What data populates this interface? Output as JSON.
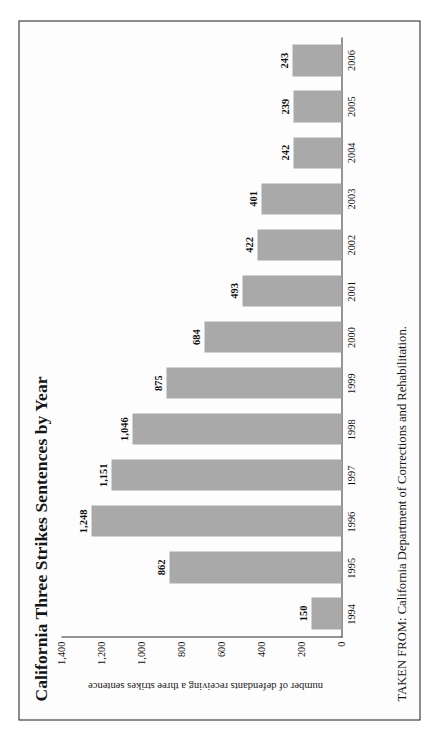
{
  "document": {
    "source_note": "TAKEN FROM: California Department of Corrections and Rehabilitation."
  },
  "chart_data": {
    "type": "bar",
    "title": "California Three Strikes Sentences by Year",
    "xlabel": "",
    "ylabel": "number of defendants receiving a three strikes sentence",
    "categories": [
      "1994",
      "1995",
      "1996",
      "1997",
      "1998",
      "1999",
      "2000",
      "2001",
      "2002",
      "2003",
      "2004",
      "2005",
      "2006"
    ],
    "values": [
      150,
      862,
      1248,
      1151,
      1046,
      875,
      684,
      493,
      422,
      401,
      242,
      239,
      243
    ],
    "value_labels": [
      "150",
      "862",
      "1,248",
      "1,151",
      "1,046",
      "875",
      "684",
      "493",
      "422",
      "401",
      "242",
      "239",
      "243"
    ],
    "ylim": [
      0,
      1400
    ],
    "yticks": [
      0,
      200,
      400,
      600,
      800,
      1000,
      1200,
      1400
    ],
    "ytick_labels": [
      "0",
      "200",
      "400",
      "600",
      "800",
      "1,000",
      "1,200",
      "1,400"
    ],
    "grid": false,
    "legend": null,
    "bar_color": "#a9a9a9",
    "orientation": "vertical"
  }
}
